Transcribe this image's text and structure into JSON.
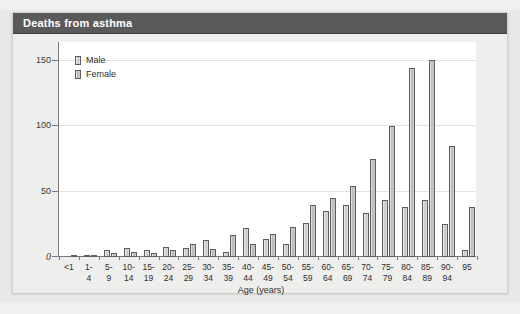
{
  "card": {
    "title": "Deaths from asthma"
  },
  "legend": {
    "position": "top-left",
    "entries": [
      {
        "label": "Male",
        "swatch": "male-swatch"
      },
      {
        "label": "Female",
        "swatch": "female-swatch"
      }
    ]
  },
  "chart_data": {
    "type": "bar",
    "title": "Deaths from asthma",
    "xlabel": "Age (years)",
    "ylabel": "",
    "ylim": [
      0,
      160
    ],
    "yticks": [
      0,
      50,
      100,
      150
    ],
    "ytick_labels": [
      "0",
      "50",
      "100",
      "150"
    ],
    "grid": true,
    "legend_position": "top-left",
    "categories": [
      "<1",
      "1-4",
      "5-9",
      "10-14",
      "15-19",
      "20-24",
      "25-29",
      "30-34",
      "35-39",
      "40-44",
      "45-49",
      "50-54",
      "55-59",
      "60-64",
      "65-69",
      "70-74",
      "75-79",
      "80-84",
      "85-89",
      "90-94",
      "95"
    ],
    "category_lines": [
      [
        "<1",
        ""
      ],
      [
        "1-",
        "4"
      ],
      [
        "5-",
        "9"
      ],
      [
        "10-",
        "14"
      ],
      [
        "15-",
        "19"
      ],
      [
        "20-",
        "24"
      ],
      [
        "25-",
        "29"
      ],
      [
        "30-",
        "34"
      ],
      [
        "35-",
        "39"
      ],
      [
        "40-",
        "44"
      ],
      [
        "45-",
        "49"
      ],
      [
        "50-",
        "54"
      ],
      [
        "55-",
        "59"
      ],
      [
        "60-",
        "64"
      ],
      [
        "65-",
        "69"
      ],
      [
        "70-",
        "74"
      ],
      [
        "75-",
        "79"
      ],
      [
        "80-",
        "84"
      ],
      [
        "85-",
        "89"
      ],
      [
        "90-",
        "94"
      ],
      [
        "95",
        ""
      ]
    ],
    "series": [
      {
        "name": "Male",
        "values": [
          0,
          1,
          5,
          7,
          5,
          8,
          7,
          13,
          4,
          22,
          14,
          10,
          26,
          35,
          40,
          34,
          44,
          38,
          44,
          25,
          5
        ]
      },
      {
        "name": "Female",
        "values": [
          1,
          1,
          3,
          4,
          3,
          5,
          10,
          6,
          17,
          10,
          18,
          23,
          40,
          45,
          54,
          75,
          100,
          145,
          151,
          85,
          38
        ]
      }
    ]
  }
}
